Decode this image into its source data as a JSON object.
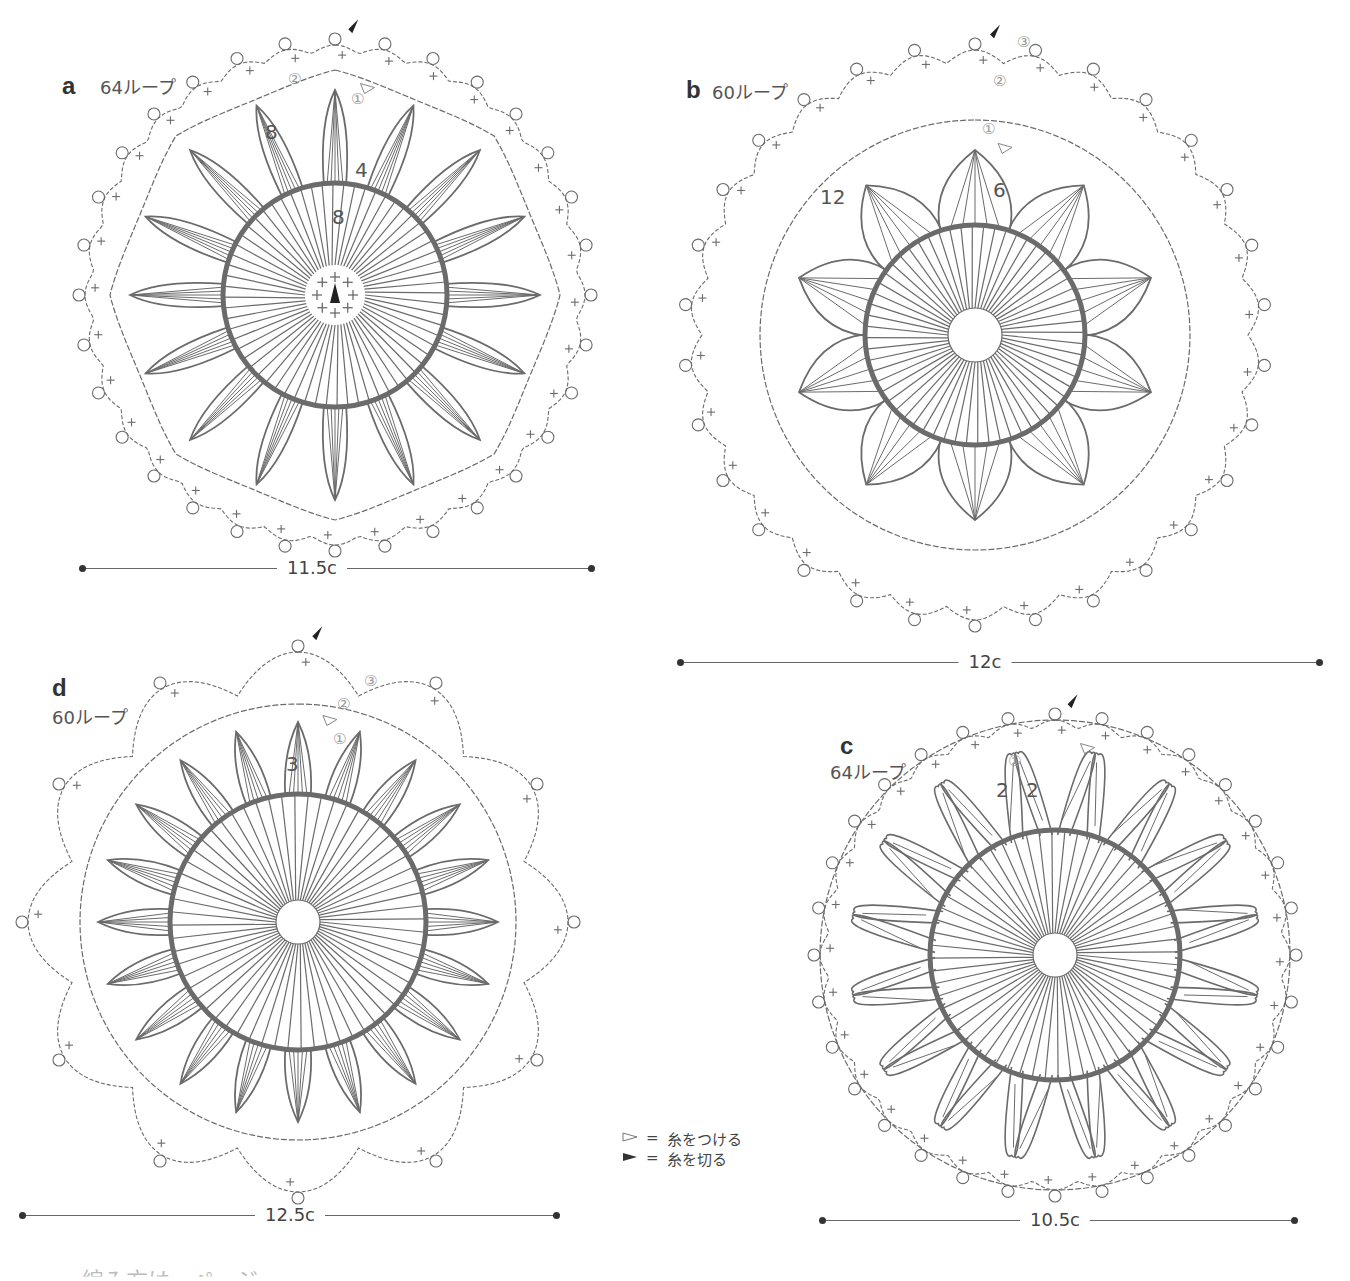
{
  "colors": {
    "stroke": "#6b6b6b",
    "thick_ring": "#6b6b6b",
    "text": "#444444",
    "circled_number": "#999999",
    "background": "#ffffff"
  },
  "motifs": [
    {
      "id": "a",
      "letter": "a",
      "loops_label": "64ループ",
      "center": [
        335,
        295
      ],
      "outer_radius": 260,
      "chain_radius": 225,
      "ring_radius": 112,
      "hole_radius": 0,
      "petal_count": 16,
      "petal_length": 205,
      "petal_style": "single",
      "chain_scallops": 8,
      "outer_style": "picot",
      "numbers": [
        {
          "text": "8",
          "x": 265,
          "y": 120
        },
        {
          "text": "4",
          "x": 355,
          "y": 158
        },
        {
          "text": "8",
          "x": 332,
          "y": 205
        }
      ],
      "circled": [
        {
          "text": "②",
          "x": 288,
          "y": 70
        },
        {
          "text": "①",
          "x": 351,
          "y": 90
        }
      ],
      "dimension": {
        "label": "11.5c",
        "x1": 82,
        "x2": 592,
        "y": 568,
        "label_x": 312
      }
    },
    {
      "id": "b",
      "letter": "b",
      "loops_label": "60ループ",
      "center": [
        975,
        335
      ],
      "outer_radius": 295,
      "chain_radius": 215,
      "ring_radius": 110,
      "hole_radius": 27,
      "petal_count": 10,
      "petal_length": 185,
      "petal_style": "wide",
      "chain_scallops": 12,
      "outer_style": "cluster",
      "numbers": [
        {
          "text": "12",
          "x": 820,
          "y": 185
        },
        {
          "text": "6",
          "x": 993,
          "y": 178
        }
      ],
      "circled": [
        {
          "text": "③",
          "x": 1017,
          "y": 33
        },
        {
          "text": "②",
          "x": 993,
          "y": 72
        },
        {
          "text": "①",
          "x": 982,
          "y": 120
        }
      ],
      "dimension": {
        "label": "12c",
        "x1": 680,
        "x2": 1320,
        "y": 662,
        "label_x": 985
      }
    },
    {
      "id": "d",
      "letter": "d",
      "loops_label": "60ループ",
      "center": [
        298,
        922
      ],
      "outer_radius": 280,
      "chain_radius": 218,
      "ring_radius": 128,
      "hole_radius": 22,
      "petal_count": 20,
      "petal_length": 200,
      "petal_style": "single",
      "chain_scallops": 12,
      "outer_style": "star",
      "numbers": [
        {
          "text": "3",
          "x": 286,
          "y": 752
        }
      ],
      "circled": [
        {
          "text": "③",
          "x": 364,
          "y": 672
        },
        {
          "text": "②",
          "x": 337,
          "y": 695
        },
        {
          "text": "①",
          "x": 333,
          "y": 730
        }
      ],
      "dimension": {
        "label": "12.5c",
        "x1": 22,
        "x2": 557,
        "y": 1215,
        "label_x": 290
      }
    },
    {
      "id": "c",
      "letter": "c",
      "loops_label": "64ループ",
      "center": [
        1055,
        955
      ],
      "outer_radius": 245,
      "chain_radius": 235,
      "ring_radius": 125,
      "hole_radius": 22,
      "petal_count": 16,
      "petal_length": 205,
      "petal_style": "crossed",
      "chain_scallops": 16,
      "outer_style": "picot",
      "numbers": [
        {
          "text": "2",
          "x": 996,
          "y": 778
        },
        {
          "text": "2",
          "x": 1026,
          "y": 778
        }
      ],
      "circled": [
        {
          "text": "①",
          "x": 1008,
          "y": 752
        }
      ],
      "dimension": {
        "label": "10.5c",
        "x1": 822,
        "x2": 1295,
        "y": 1220,
        "label_x": 1055
      }
    }
  ],
  "legend": [
    {
      "symbol": "open-triangle",
      "equals": "=",
      "text": "糸をつける"
    },
    {
      "symbol": "filled-triangle",
      "equals": "=",
      "text": "糸を切る"
    }
  ],
  "footer_text_partial": "…編み方は…ページ"
}
